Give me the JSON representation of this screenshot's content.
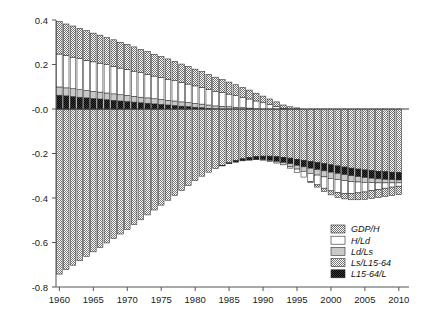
{
  "chart_data": {
    "type": "bar",
    "subtype": "stacked-bar-diverging",
    "title": "",
    "subtitle": "",
    "xlabel": "",
    "ylabel": "",
    "xlim": [
      1959.5,
      2011.5
    ],
    "ylim": [
      -0.8,
      0.4
    ],
    "yticks": [
      0.4,
      0.2,
      -0.0,
      -0.2,
      -0.4,
      -0.6,
      -0.8
    ],
    "ytick_labels": [
      "0.4",
      "0.2",
      "-0.0",
      "-0.2",
      "-0.4",
      "-0.6",
      "-0.8"
    ],
    "xticks": [
      1960,
      1965,
      1970,
      1975,
      1980,
      1985,
      1990,
      1995,
      2000,
      2005,
      2010
    ],
    "xtick_labels": [
      "1960",
      "1965",
      "1970",
      "1975",
      "1980",
      "1985",
      "1990",
      "1995",
      "2000",
      "2005",
      "2010"
    ],
    "grid": false,
    "zero_line": true,
    "legend_position": "bottom-right",
    "x": [
      1960,
      1961,
      1962,
      1963,
      1964,
      1965,
      1966,
      1967,
      1968,
      1969,
      1970,
      1971,
      1972,
      1973,
      1974,
      1975,
      1976,
      1977,
      1978,
      1979,
      1980,
      1981,
      1982,
      1983,
      1984,
      1985,
      1986,
      1987,
      1988,
      1989,
      1990,
      1991,
      1992,
      1993,
      1994,
      1995,
      1996,
      1997,
      1998,
      1999,
      2000,
      2001,
      2002,
      2003,
      2004,
      2005,
      2006,
      2007,
      2008,
      2009,
      2010
    ],
    "series": [
      {
        "name": "GDP/H",
        "pattern": "checker-medium",
        "color": "#9a9a9a",
        "values": [
          0.146,
          0.142,
          0.14,
          0.136,
          0.133,
          0.129,
          0.126,
          0.122,
          0.119,
          0.116,
          0.112,
          0.109,
          0.105,
          0.102,
          0.098,
          0.094,
          0.091,
          0.087,
          0.083,
          0.079,
          0.075,
          0.071,
          0.067,
          0.063,
          0.058,
          0.054,
          0.049,
          0.044,
          0.04,
          0.035,
          0.03,
          0.025,
          0.02,
          0.015,
          0.01,
          0.005,
          0.0,
          -0.005,
          -0.01,
          -0.014,
          -0.018,
          -0.022,
          -0.025,
          -0.028,
          -0.031,
          -0.033,
          -0.035,
          -0.036,
          -0.037,
          -0.038,
          -0.038
        ]
      },
      {
        "name": "H/Ld",
        "pattern": "solid-white",
        "color": "#ffffff",
        "values": [
          0.148,
          0.145,
          0.142,
          0.139,
          0.136,
          0.133,
          0.13,
          0.127,
          0.124,
          0.12,
          0.117,
          0.113,
          0.11,
          0.106,
          0.102,
          0.099,
          0.095,
          0.091,
          0.087,
          0.083,
          0.079,
          0.075,
          0.071,
          0.066,
          0.062,
          0.057,
          0.052,
          0.047,
          0.041,
          0.035,
          0.028,
          0.02,
          0.012,
          0.003,
          -0.006,
          -0.016,
          -0.026,
          -0.036,
          -0.044,
          -0.051,
          -0.056,
          -0.058,
          -0.057,
          -0.054,
          -0.049,
          -0.043,
          -0.036,
          -0.03,
          -0.024,
          -0.019,
          -0.015
        ]
      },
      {
        "name": "Ld/Ls",
        "pattern": "solid-lightgray",
        "color": "#c9c9c9",
        "values": [
          0.037,
          0.036,
          0.035,
          0.034,
          0.033,
          0.032,
          0.031,
          0.03,
          0.029,
          0.028,
          0.027,
          0.026,
          0.025,
          0.024,
          0.023,
          0.022,
          0.021,
          0.02,
          0.019,
          0.018,
          0.017,
          0.016,
          0.015,
          0.013,
          0.012,
          0.01,
          0.008,
          0.006,
          0.004,
          0.001,
          -0.002,
          -0.005,
          -0.008,
          -0.011,
          -0.014,
          -0.017,
          -0.02,
          -0.023,
          -0.025,
          -0.027,
          -0.028,
          -0.028,
          -0.027,
          -0.026,
          -0.024,
          -0.022,
          -0.02,
          -0.018,
          -0.016,
          -0.014,
          -0.013
        ]
      },
      {
        "name": "Ls/L15-64",
        "pattern": "checker-dense",
        "color": "#8f8f8f",
        "values": [
          -0.742,
          -0.722,
          -0.702,
          -0.682,
          -0.662,
          -0.642,
          -0.622,
          -0.602,
          -0.582,
          -0.562,
          -0.542,
          -0.52,
          -0.498,
          -0.476,
          -0.454,
          -0.432,
          -0.41,
          -0.388,
          -0.366,
          -0.344,
          -0.322,
          -0.302,
          -0.284,
          -0.268,
          -0.254,
          -0.242,
          -0.232,
          -0.224,
          -0.218,
          -0.214,
          -0.212,
          -0.212,
          -0.214,
          -0.217,
          -0.221,
          -0.226,
          -0.231,
          -0.236,
          -0.241,
          -0.246,
          -0.251,
          -0.256,
          -0.261,
          -0.266,
          -0.27,
          -0.274,
          -0.277,
          -0.28,
          -0.282,
          -0.284,
          -0.285
        ]
      },
      {
        "name": "L15-64/L",
        "pattern": "checker-dark",
        "color": "#1c1c1c",
        "values": [
          0.062,
          0.059,
          0.056,
          0.053,
          0.05,
          0.047,
          0.045,
          0.042,
          0.039,
          0.036,
          0.034,
          0.031,
          0.028,
          0.026,
          0.023,
          0.021,
          0.018,
          0.016,
          0.013,
          0.011,
          0.008,
          0.006,
          0.003,
          0.001,
          -0.002,
          -0.004,
          -0.007,
          -0.009,
          -0.012,
          -0.014,
          -0.016,
          -0.019,
          -0.021,
          -0.023,
          -0.025,
          -0.027,
          -0.029,
          -0.03,
          -0.031,
          -0.032,
          -0.033,
          -0.033,
          -0.034,
          -0.034,
          -0.034,
          -0.034,
          -0.034,
          -0.034,
          -0.034,
          -0.034,
          -0.034
        ]
      }
    ],
    "legend": [
      {
        "label": "GDP/H",
        "pattern": "checker-medium"
      },
      {
        "label": "H/Ld",
        "pattern": "solid-white"
      },
      {
        "label": "Ld/Ls",
        "pattern": "solid-lightgray"
      },
      {
        "label": "Ls/L15-64",
        "pattern": "checker-dense"
      },
      {
        "label": "L15-64/L",
        "pattern": "checker-dark"
      }
    ]
  }
}
